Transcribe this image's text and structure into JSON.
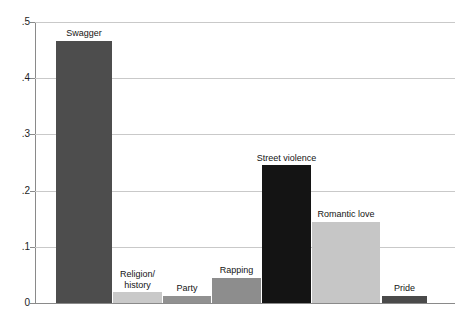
{
  "chart_data": {
    "type": "bar",
    "title": "",
    "subtitle": "",
    "xlabel": "",
    "ylabel": "",
    "ylim": [
      0,
      0.5
    ],
    "grid": "horizontal",
    "legend": "none",
    "categories": [
      "Swagger",
      "Religion/\nhistory",
      "Party",
      "Rapping",
      "Street violence",
      "Romantic love",
      "Pride"
    ],
    "values": [
      0.467,
      0.019,
      0.013,
      0.045,
      0.245,
      0.145,
      0.013
    ],
    "bar_colors": [
      "#4d4d4d",
      "#c9c9c9",
      "#919191",
      "#8d8d8d",
      "#141414",
      "#c6c6c6",
      "#4a4a4a"
    ],
    "ytick_labels": [
      "0",
      ".1",
      ".2",
      ".3",
      ".4",
      ".5"
    ],
    "ytick_values": [
      0,
      0.1,
      0.2,
      0.3,
      0.4,
      0.5
    ]
  },
  "axis": {
    "line_color": "#8a8a8a",
    "grid_color": "#c9c9c9"
  }
}
